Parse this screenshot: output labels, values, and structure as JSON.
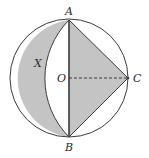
{
  "figure": {
    "labels": {
      "A": "A",
      "B": "B",
      "C": "C",
      "O": "O",
      "X": "X"
    },
    "colors": {
      "shade": "#c4c4c4",
      "stroke": "#3a3a3a",
      "background": "#ffffff"
    }
  }
}
